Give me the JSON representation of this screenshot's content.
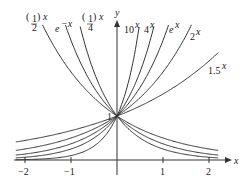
{
  "chart_data": {
    "type": "line",
    "title": "",
    "xlabel": "x",
    "ylabel": "y",
    "xlim": [
      -2.2,
      2.2
    ],
    "ylim": [
      0,
      3.1
    ],
    "grid": false,
    "x_ticks": [
      "−2",
      "−1",
      "1",
      "2"
    ],
    "y_ticks": [
      "1"
    ],
    "series": [
      {
        "name": "(1/2)^x",
        "base": 0.5
      },
      {
        "name": "e^{-x}",
        "base": 0.36788
      },
      {
        "name": "(1/4)^x",
        "base": 0.25
      },
      {
        "name": "10^x",
        "base": 10
      },
      {
        "name": "4^x",
        "base": 4
      },
      {
        "name": "e^x",
        "base": 2.71828
      },
      {
        "name": "2^x",
        "base": 2
      },
      {
        "name": "1.5^x",
        "base": 1.5
      }
    ],
    "annotations": "All curves pass through (0, 1)"
  },
  "labels": {
    "x_axis": "x",
    "y_axis": "y",
    "tick_m2": "−2",
    "tick_m1": "−1",
    "tick_1": "1",
    "tick_2": "2",
    "y_one": "1",
    "half_num": "1",
    "half_den": "2",
    "quarter_num": "1",
    "quarter_den": "4",
    "sup_x": "x",
    "e_base": "e",
    "neg_x": "−x",
    "ten": "10",
    "four": "4",
    "two": "2",
    "one_five": "1.5"
  }
}
